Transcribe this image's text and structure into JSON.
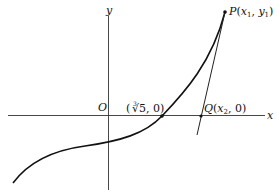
{
  "diagram": {
    "type": "function-graph-newton-method",
    "axes": {
      "x_label": "x",
      "y_label": "y",
      "origin_label": "O"
    },
    "points": {
      "root": {
        "label_open": "(",
        "label_radical_index": "3",
        "label_radical": "√5",
        "label_close": ", 0)",
        "full_label": "(∛5, 0)"
      },
      "P": {
        "name": "P",
        "open": "(",
        "x_var": "x",
        "x_sub": "1",
        "sep": ", ",
        "y_var": "y",
        "y_sub": "1",
        "close": ")",
        "full_label": "P(x1, y1)"
      },
      "Q": {
        "name": "Q",
        "open": "(",
        "x_var": "x",
        "x_sub": "2",
        "rest": ", 0)",
        "full_label": "Q(x2, 0)"
      }
    },
    "curve": "cubic-like curve y = x^3 - 5 crossing x-axis at cube root of 5",
    "tangent_line": "tangent at P intersecting x-axis at Q",
    "colors": {
      "stroke": "#111111",
      "background": "#ffffff"
    }
  }
}
